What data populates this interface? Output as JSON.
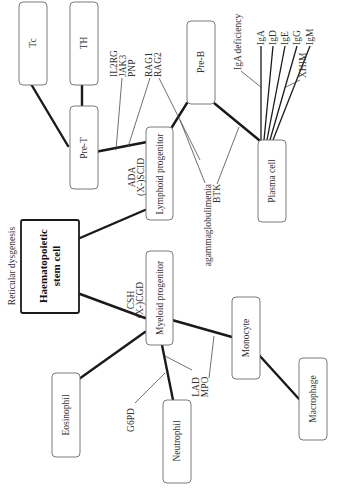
{
  "diagram": {
    "stem_cell": {
      "line1": "Haematopoietic",
      "line2": "stem cell"
    },
    "annotation_top": "Reticular dysgenesis",
    "cells": {
      "tc": "Tc",
      "th": "TH",
      "pre_t": "Pre-T",
      "lymphoid": "Lymphoid progenitor",
      "pre_b": "Pre-B",
      "plasma": "Plasma cell",
      "myeloid": "Myeloid progenitor",
      "monocyte": "Monocyte",
      "macrophage": "Macrophage",
      "neutrophil": "Neutrophil",
      "eosinophil": "Eosinophil"
    },
    "defects": {
      "il2rg": "IL2RG",
      "jak3": "JAK3",
      "pnp": "PNP",
      "rag1": "RAG1",
      "rag2": "RAG2",
      "ada": "ADA",
      "xscid": "(X-)SCID",
      "agamma": "agammaglobulimenia",
      "btk": "BTK",
      "iga_def": "IgA deficiency",
      "iga": "IgA",
      "igd": "IgD",
      "ige": "IgE",
      "igg": "IgG",
      "igm": "IgM",
      "xhim": "XHIM",
      "csh": "CSH",
      "xcgd": "(X-)CGD",
      "lad": "LAD",
      "mpo": "MPO",
      "g6pd": "G6PD"
    }
  }
}
